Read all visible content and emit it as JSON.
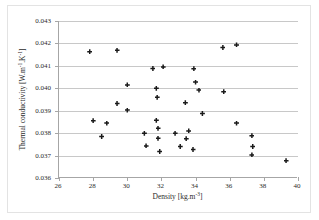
{
  "chart_data": {
    "type": "scatter",
    "title": "",
    "xlabel": "Density [kg.m-3]",
    "ylabel": "Thermal conductivity [W.m-1.K-1]",
    "xlim": [
      26,
      40
    ],
    "ylim": [
      0.036,
      0.043
    ],
    "xticks": [
      26,
      28,
      30,
      32,
      34,
      36,
      38,
      40
    ],
    "yticks": [
      0.036,
      0.037,
      0.038,
      0.039,
      0.04,
      0.041,
      0.042,
      0.043
    ],
    "xtick_labels": [
      "26",
      "28",
      "30",
      "32",
      "34",
      "36",
      "38",
      "40"
    ],
    "ytick_labels": [
      "0.036",
      "0.037",
      "0.038",
      "0.039",
      "0.040",
      "0.041",
      "0.042",
      "0.043"
    ],
    "grid": "horizontal",
    "legend": "none",
    "marker": "black-plus",
    "series": [
      {
        "name": "samples",
        "points": [
          [
            27.8,
            0.04163
          ],
          [
            28.0,
            0.03855
          ],
          [
            28.5,
            0.03785
          ],
          [
            28.8,
            0.03845
          ],
          [
            29.4,
            0.0417
          ],
          [
            29.4,
            0.03932
          ],
          [
            30.0,
            0.04015
          ],
          [
            30.0,
            0.03903
          ],
          [
            31.0,
            0.038
          ],
          [
            31.1,
            0.03743
          ],
          [
            31.5,
            0.04088
          ],
          [
            31.7,
            0.04
          ],
          [
            31.7,
            0.03858
          ],
          [
            31.75,
            0.0396
          ],
          [
            31.8,
            0.03822
          ],
          [
            31.8,
            0.03777
          ],
          [
            31.9,
            0.03718
          ],
          [
            32.1,
            0.04095
          ],
          [
            32.8,
            0.038
          ],
          [
            33.1,
            0.0374
          ],
          [
            33.4,
            0.03935
          ],
          [
            33.45,
            0.03775
          ],
          [
            33.6,
            0.0381
          ],
          [
            33.85,
            0.03727
          ],
          [
            33.9,
            0.04087
          ],
          [
            34.0,
            0.04028
          ],
          [
            34.2,
            0.03992
          ],
          [
            34.4,
            0.03888
          ],
          [
            35.6,
            0.04182
          ],
          [
            35.65,
            0.03985
          ],
          [
            36.4,
            0.04193
          ],
          [
            36.4,
            0.03845
          ],
          [
            37.3,
            0.03788
          ],
          [
            37.35,
            0.0374
          ],
          [
            37.3,
            0.03703
          ],
          [
            39.3,
            0.03677
          ]
        ]
      }
    ]
  }
}
